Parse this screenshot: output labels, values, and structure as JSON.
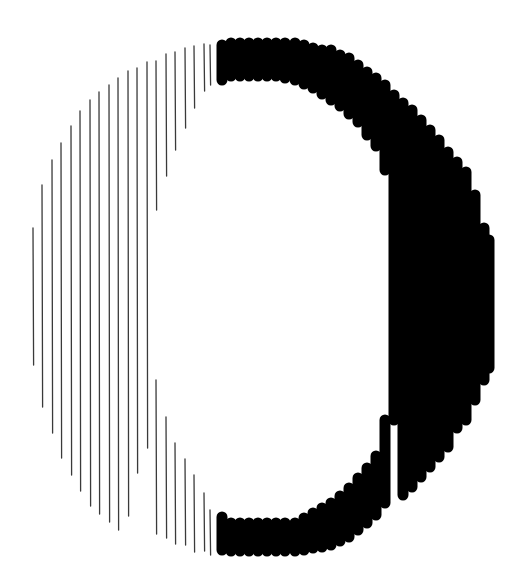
{
  "figure": {
    "width": 527,
    "height": 588,
    "colors": {
      "background": "#ffffff",
      "hatch": "#3a3a3a",
      "bold": "#000000"
    }
  },
  "hatch_lines": [
    {
      "x": 33,
      "y1": 228,
      "y2": 365
    },
    {
      "x": 42,
      "y1": 185,
      "y2": 407
    },
    {
      "x": 52,
      "y1": 160,
      "y2": 433
    },
    {
      "x": 61,
      "y1": 143,
      "y2": 458
    },
    {
      "x": 71,
      "y1": 126,
      "y2": 475
    },
    {
      "x": 80,
      "y1": 111,
      "y2": 491
    },
    {
      "x": 90,
      "y1": 100,
      "y2": 506
    },
    {
      "x": 99,
      "y1": 92,
      "y2": 514
    },
    {
      "x": 109,
      "y1": 85,
      "y2": 522
    },
    {
      "x": 118,
      "y1": 78,
      "y2": 530
    },
    {
      "x": 128,
      "y1": 71,
      "y2": 516
    },
    {
      "x": 137,
      "y1": 68,
      "y2": 473
    },
    {
      "x": 147,
      "y1": 62,
      "y2": 448
    },
    {
      "x": 156,
      "y1": 61,
      "y2": 210
    },
    {
      "x": 156,
      "y1": 380,
      "y2": 534
    },
    {
      "x": 166,
      "y1": 54,
      "y2": 176
    },
    {
      "x": 166,
      "y1": 417,
      "y2": 538
    },
    {
      "x": 175,
      "y1": 52,
      "y2": 150
    },
    {
      "x": 175,
      "y1": 443,
      "y2": 544
    },
    {
      "x": 185,
      "y1": 48,
      "y2": 128
    },
    {
      "x": 185,
      "y1": 459,
      "y2": 545
    },
    {
      "x": 194,
      "y1": 46,
      "y2": 108
    },
    {
      "x": 194,
      "y1": 475,
      "y2": 552
    },
    {
      "x": 204,
      "y1": 44,
      "y2": 91
    },
    {
      "x": 204,
      "y1": 493,
      "y2": 551
    },
    {
      "x": 210,
      "y1": 45,
      "y2": 85
    },
    {
      "x": 210,
      "y1": 510,
      "y2": 555
    }
  ],
  "bold_columns": [
    {
      "x": 222,
      "segs": [
        [
          45,
          80
        ],
        [
          517,
          550
        ]
      ]
    },
    {
      "x": 231,
      "segs": [
        [
          43,
          76
        ],
        [
          523,
          551
        ]
      ]
    },
    {
      "x": 240,
      "segs": [
        [
          43,
          76
        ],
        [
          523,
          551
        ]
      ]
    },
    {
      "x": 249,
      "segs": [
        [
          43,
          76
        ],
        [
          523,
          551
        ]
      ]
    },
    {
      "x": 258,
      "segs": [
        [
          43,
          76
        ],
        [
          523,
          551
        ]
      ]
    },
    {
      "x": 267,
      "segs": [
        [
          43,
          76
        ],
        [
          523,
          551
        ]
      ]
    },
    {
      "x": 276,
      "segs": [
        [
          43,
          76
        ],
        [
          523,
          551
        ]
      ]
    },
    {
      "x": 285,
      "segs": [
        [
          43,
          78
        ],
        [
          523,
          551
        ]
      ]
    },
    {
      "x": 295,
      "segs": [
        [
          43,
          80
        ],
        [
          523,
          551
        ]
      ]
    },
    {
      "x": 304,
      "segs": [
        [
          45,
          84
        ],
        [
          518,
          550
        ]
      ]
    },
    {
      "x": 313,
      "segs": [
        [
          48,
          88
        ],
        [
          513,
          548
        ]
      ]
    },
    {
      "x": 322,
      "segs": [
        [
          50,
          94
        ],
        [
          508,
          547
        ]
      ]
    },
    {
      "x": 331,
      "segs": [
        [
          50,
          100
        ],
        [
          503,
          545
        ]
      ]
    },
    {
      "x": 340,
      "segs": [
        [
          55,
          106
        ],
        [
          496,
          541
        ]
      ]
    },
    {
      "x": 349,
      "segs": [
        [
          58,
          114
        ],
        [
          488,
          537
        ]
      ]
    },
    {
      "x": 358,
      "segs": [
        [
          65,
          122
        ],
        [
          478,
          530
        ]
      ]
    },
    {
      "x": 367,
      "segs": [
        [
          72,
          135
        ],
        [
          468,
          523
        ]
      ]
    },
    {
      "x": 376,
      "segs": [
        [
          78,
          146
        ],
        [
          456,
          515
        ]
      ]
    },
    {
      "x": 385,
      "segs": [
        [
          85,
          170
        ],
        [
          420,
          503
        ]
      ]
    },
    {
      "x": 394,
      "segs": [
        [
          95,
          420
        ]
      ]
    },
    {
      "x": 403,
      "segs": [
        [
          103,
          495
        ]
      ]
    },
    {
      "x": 412,
      "segs": [
        [
          110,
          487
        ]
      ]
    },
    {
      "x": 421,
      "segs": [
        [
          120,
          477
        ]
      ]
    },
    {
      "x": 430,
      "segs": [
        [
          130,
          467
        ]
      ]
    },
    {
      "x": 439,
      "segs": [
        [
          140,
          457
        ]
      ]
    },
    {
      "x": 448,
      "segs": [
        [
          152,
          447
        ]
      ]
    },
    {
      "x": 457,
      "segs": [
        [
          162,
          428
        ]
      ]
    },
    {
      "x": 466,
      "segs": [
        [
          172,
          420
        ]
      ]
    },
    {
      "x": 475,
      "segs": [
        [
          195,
          400
        ]
      ]
    },
    {
      "x": 484,
      "segs": [
        [
          228,
          380
        ]
      ]
    },
    {
      "x": 489,
      "segs": [
        [
          240,
          368
        ]
      ]
    }
  ]
}
